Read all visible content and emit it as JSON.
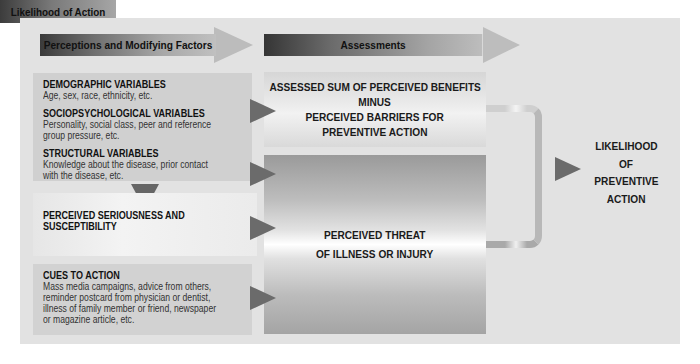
{
  "header": {
    "perceptions": "Perceptions and Modifying Factors",
    "assessments": "Assessments",
    "likelihood": "Likelihood of Action"
  },
  "factors": {
    "groups": [
      {
        "title": "DEMOGRAPHIC VARIABLES",
        "lines": [
          "Age, sex, race, ethnicity, etc."
        ]
      },
      {
        "title": "SOCIOPSYCHOLOGICAL VARIABLES",
        "lines": [
          "Personality, social class, peer and reference",
          "group pressure, etc."
        ]
      },
      {
        "title": "STRUCTURAL VARIABLES",
        "lines": [
          "Knowledge about the disease, prior contact",
          "with the disease, etc."
        ]
      }
    ]
  },
  "seriousness": {
    "lines": [
      "PERCEIVED SERIOUSNESS AND",
      "SUSCEPTIBILITY"
    ]
  },
  "cues": {
    "title": "CUES TO ACTION",
    "lines": [
      "Mass media campaigns, advice from others,",
      "reminder postcard from physician or dentist,",
      "illness of family member or friend, newspaper",
      "or magazine article, etc."
    ]
  },
  "assessment": {
    "lines": [
      "ASSESSED SUM OF PERCEIVED BENEFITS",
      "MINUS",
      "PERCEIVED BARRIERS FOR",
      "PREVENTIVE ACTION"
    ]
  },
  "threat": {
    "lines": [
      "PERCEIVED THREAT",
      "OF ILLNESS OR INJURY"
    ]
  },
  "outcome": {
    "lines": [
      "LIKELIHOOD",
      "OF",
      "PREVENTIVE",
      "ACTION"
    ]
  },
  "colors": {
    "panel": "#e2e2e2",
    "header_dark": "#3a3a3a",
    "arrow": "#6b6b6b",
    "text": "#1a1a1a"
  }
}
